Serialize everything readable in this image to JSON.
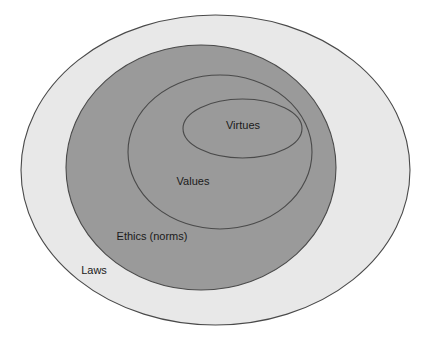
{
  "diagram": {
    "type": "concentric-ellipses",
    "title": "",
    "background_color": "#ffffff",
    "canvas": {
      "width": 423,
      "height": 346
    },
    "rings": [
      {
        "id": "laws",
        "label": "Laws",
        "level": 1,
        "fill": "#e8e8e8",
        "stroke": "#4a4a4a",
        "cx": 215.5,
        "cy": 170,
        "rx": 194.5,
        "ry": 155,
        "label_x": 94,
        "label_y": 271,
        "label_anchor": "middle"
      },
      {
        "id": "ethics-norms",
        "label": "Ethics (norms)",
        "level": 2,
        "fill": "#9a9a9a",
        "stroke": "#4a4a4a",
        "cx": 201,
        "cy": 167.5,
        "rx": 135,
        "ry": 122.5,
        "label_x": 152,
        "label_y": 237,
        "label_anchor": "middle"
      },
      {
        "id": "values",
        "label": "Values",
        "level": 3,
        "fill": "#9a9a9a",
        "stroke": "#4a4a4a",
        "cx": 220,
        "cy": 152,
        "rx": 92,
        "ry": 77,
        "label_x": 193,
        "label_y": 182,
        "label_anchor": "middle"
      },
      {
        "id": "virtues",
        "label": "Virtues",
        "level": 4,
        "fill": "#9a9a9a",
        "stroke": "#4a4a4a",
        "cx": 242.5,
        "cy": 128.5,
        "rx": 59.5,
        "ry": 29.5,
        "label_x": 243,
        "label_y": 126,
        "label_anchor": "middle"
      }
    ]
  }
}
